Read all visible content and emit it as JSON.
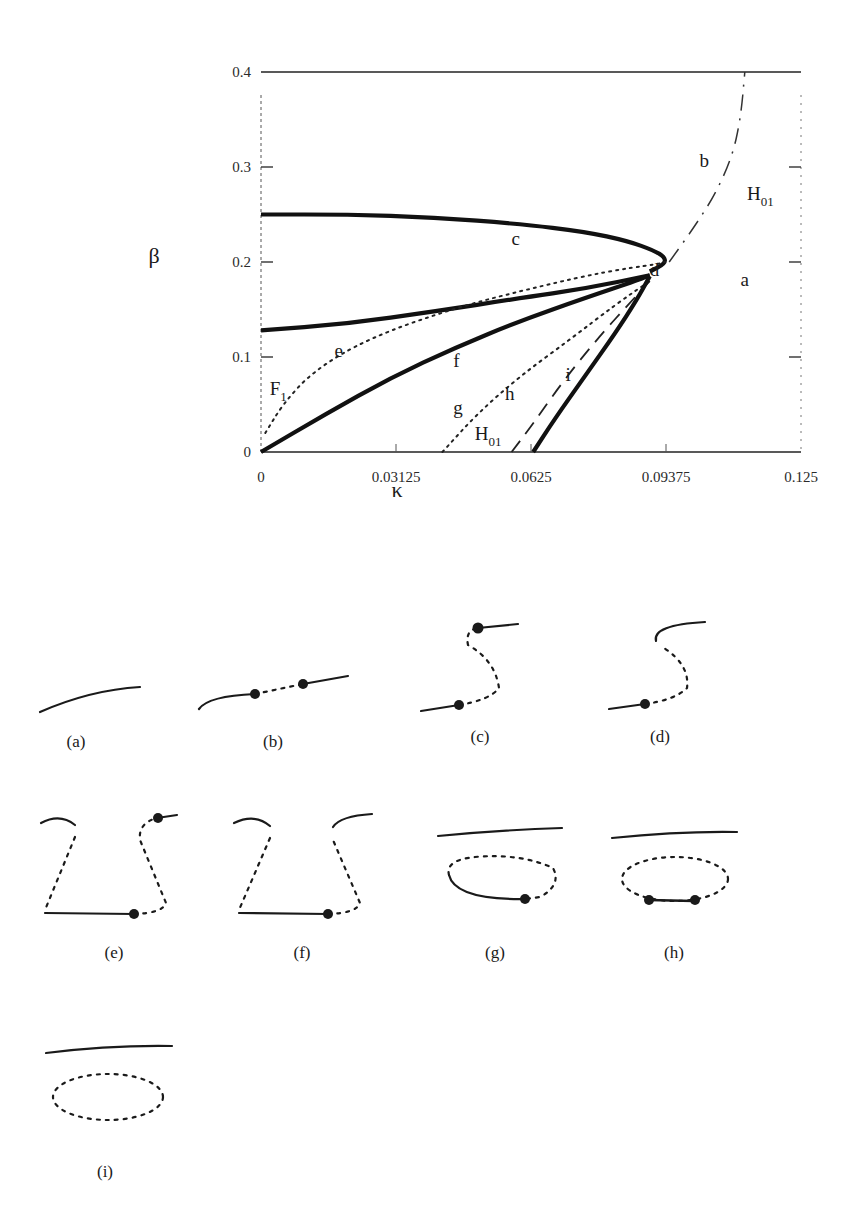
{
  "chart_data": {
    "type": "line",
    "title": "",
    "xlabel": "κ",
    "ylabel": "β",
    "xlim": [
      0,
      0.125
    ],
    "ylim": [
      0,
      0.4
    ],
    "x_ticks": [
      "0",
      "0.03125",
      "0.0625",
      "0.09375",
      "0.125"
    ],
    "y_ticks": [
      "0",
      "0.1",
      "0.2",
      "0.3",
      "0.4"
    ],
    "grid": false,
    "series": [
      {
        "name": "upper fold (solid)",
        "style": "solid-thick",
        "points": [
          [
            0,
            0.25
          ],
          [
            0.02,
            0.25
          ],
          [
            0.04,
            0.247
          ],
          [
            0.06,
            0.24
          ],
          [
            0.075,
            0.232
          ],
          [
            0.085,
            0.222
          ],
          [
            0.091,
            0.212
          ],
          [
            0.0935,
            0.205
          ],
          [
            0.0935,
            0.198
          ],
          [
            0.09,
            0.19
          ]
        ]
      },
      {
        "name": "lower fold (solid)",
        "style": "solid-thick",
        "points": [
          [
            0,
            0.128
          ],
          [
            0.02,
            0.135
          ],
          [
            0.04,
            0.148
          ],
          [
            0.06,
            0.162
          ],
          [
            0.075,
            0.172
          ],
          [
            0.09,
            0.186
          ]
        ]
      },
      {
        "name": "F1 (dotted)",
        "style": "dotted",
        "points": [
          [
            0.001,
            0.02
          ],
          [
            0.005,
            0.05
          ],
          [
            0.012,
            0.085
          ],
          [
            0.025,
            0.12
          ],
          [
            0.045,
            0.152
          ],
          [
            0.065,
            0.175
          ],
          [
            0.08,
            0.19
          ],
          [
            0.092,
            0.198
          ],
          [
            0.0935,
            0.2
          ]
        ]
      },
      {
        "name": "g boundary (solid)",
        "style": "solid-thick",
        "points": [
          [
            0,
            0
          ],
          [
            0.015,
            0.04
          ],
          [
            0.03,
            0.078
          ],
          [
            0.045,
            0.11
          ],
          [
            0.06,
            0.138
          ],
          [
            0.075,
            0.162
          ],
          [
            0.088,
            0.182
          ],
          [
            0.09,
            0.186
          ]
        ]
      },
      {
        "name": "h boundary (dotted)",
        "style": "dotted",
        "points": [
          [
            0.042,
            0
          ],
          [
            0.05,
            0.04
          ],
          [
            0.06,
            0.08
          ],
          [
            0.072,
            0.12
          ],
          [
            0.082,
            0.155
          ],
          [
            0.09,
            0.18
          ]
        ]
      },
      {
        "name": "H01 lower (dashed)",
        "style": "dashed",
        "points": [
          [
            0.058,
            0
          ],
          [
            0.063,
            0.03
          ],
          [
            0.07,
            0.075
          ],
          [
            0.078,
            0.12
          ],
          [
            0.086,
            0.16
          ],
          [
            0.09,
            0.18
          ]
        ]
      },
      {
        "name": "i boundary (solid)",
        "style": "solid-thick",
        "points": [
          [
            0.063,
            0
          ],
          [
            0.068,
            0.035
          ],
          [
            0.075,
            0.08
          ],
          [
            0.082,
            0.125
          ],
          [
            0.087,
            0.16
          ],
          [
            0.09,
            0.185
          ]
        ]
      },
      {
        "name": "H01 upper (dash-dot)",
        "style": "dashdot",
        "points": [
          [
            0.0945,
            0.2
          ],
          [
            0.1,
            0.235
          ],
          [
            0.105,
            0.27
          ],
          [
            0.109,
            0.31
          ],
          [
            0.111,
            0.35
          ],
          [
            0.112,
            0.4
          ]
        ]
      }
    ],
    "annotations": [
      {
        "text": "a",
        "x": 0.111,
        "y": 0.175
      },
      {
        "text": "b",
        "x": 0.1015,
        "y": 0.3
      },
      {
        "text": "c",
        "x": 0.058,
        "y": 0.218
      },
      {
        "text": "d",
        "x": 0.09,
        "y": 0.185
      },
      {
        "text": "e",
        "x": 0.017,
        "y": 0.1
      },
      {
        "text": "f",
        "x": 0.0445,
        "y": 0.09
      },
      {
        "text": "g",
        "x": 0.0445,
        "y": 0.04
      },
      {
        "text": "h",
        "x": 0.0565,
        "y": 0.055
      },
      {
        "text": "i",
        "x": 0.0705,
        "y": 0.075
      },
      {
        "text": "F",
        "sub": "1",
        "x": 0.002,
        "y": 0.06
      },
      {
        "text": "H",
        "sub": "01",
        "x": 0.0495,
        "y": 0.013
      },
      {
        "text": "H",
        "sub": "01",
        "x": 0.1125,
        "y": 0.265
      }
    ]
  },
  "subfigures": [
    {
      "id": "a",
      "label": "(a)"
    },
    {
      "id": "b",
      "label": "(b)"
    },
    {
      "id": "c",
      "label": "(c)"
    },
    {
      "id": "d",
      "label": "(d)"
    },
    {
      "id": "e",
      "label": "(e)"
    },
    {
      "id": "f",
      "label": "(f)"
    },
    {
      "id": "g",
      "label": "(g)"
    },
    {
      "id": "h",
      "label": "(h)"
    },
    {
      "id": "i",
      "label": "(i)"
    }
  ]
}
